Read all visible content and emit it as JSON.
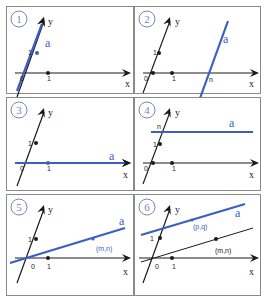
{
  "colors": {
    "line_a": "#3a5fc0",
    "axis": "#1a1a1a",
    "badge": "#7a86b8",
    "border": "#8a8a8a"
  },
  "panels": [
    {
      "id": 1,
      "badge": "1",
      "box": {
        "x": 6,
        "y": 6,
        "w": 128,
        "h": 88
      },
      "origin": {
        "x": 22,
        "y": 66
      },
      "x_axis": {
        "x1": 8,
        "x2": 124,
        "label": "x",
        "label_pos": {
          "x": 118,
          "y": 80
        }
      },
      "y_axis": {
        "x1": 10,
        "y1": 90,
        "x2": 37,
        "y2": 10,
        "label": "y",
        "label_pos": {
          "x": 41,
          "y": 18
        }
      },
      "ticks": [
        {
          "label": "0",
          "x": 13,
          "y": 74,
          "dot": false
        },
        {
          "label": "1",
          "x": 21,
          "y": 48,
          "dot": true,
          "dx": 30,
          "dy": 46,
          "blue": true
        },
        {
          "label": "1",
          "x": 40,
          "y": 74,
          "dot": true,
          "dx": 41,
          "dy": 66
        }
      ],
      "line_a": {
        "x1": 10,
        "y1": 84,
        "x2": 36,
        "y2": 14,
        "arrow": true
      },
      "a_label": {
        "text": "a",
        "x": 38,
        "y": 40
      },
      "points": [],
      "extra_lines": []
    },
    {
      "id": 2,
      "badge": "2",
      "box": {
        "x": 134,
        "y": 6,
        "w": 127,
        "h": 88
      },
      "origin": {
        "x": 18,
        "y": 66
      },
      "x_axis": {
        "x1": 8,
        "x2": 124,
        "label": "x",
        "label_pos": {
          "x": 114,
          "y": 80
        }
      },
      "y_axis": {
        "x1": 8,
        "y1": 86,
        "x2": 35,
        "y2": 10,
        "label": "y",
        "label_pos": {
          "x": 40,
          "y": 18
        }
      },
      "ticks": [
        {
          "label": "0",
          "x": 9,
          "y": 74,
          "dot": true,
          "dx": 18,
          "dy": 66
        },
        {
          "label": "1",
          "x": 18,
          "y": 48,
          "dot": true,
          "dx": 24,
          "dy": 46
        },
        {
          "label": "1",
          "x": 37,
          "y": 74,
          "dot": true,
          "dx": 37,
          "dy": 66
        }
      ],
      "line_a": {
        "x1": 64,
        "y1": 94,
        "x2": 93,
        "y2": 14,
        "arrow": false
      },
      "a_label": {
        "text": "a",
        "x": 88,
        "y": 36
      },
      "points": [],
      "n_label": {
        "text": "n",
        "x": 74,
        "y": 75
      },
      "extra_lines": []
    },
    {
      "id": 3,
      "badge": "3",
      "box": {
        "x": 6,
        "y": 97,
        "w": 128,
        "h": 94
      },
      "origin": {
        "x": 22,
        "y": 65
      },
      "x_axis": {
        "x1": 8,
        "x2": 124,
        "label": "x",
        "label_pos": {
          "x": 116,
          "y": 80
        }
      },
      "y_axis": {
        "x1": 10,
        "y1": 88,
        "x2": 37,
        "y2": 10,
        "label": "y",
        "label_pos": {
          "x": 41,
          "y": 18
        }
      },
      "ticks": [
        {
          "label": "0",
          "x": 13,
          "y": 73,
          "dot": false
        },
        {
          "label": "1",
          "x": 21,
          "y": 48,
          "dot": true,
          "dx": 29,
          "dy": 45
        },
        {
          "label": "1",
          "x": 40,
          "y": 73,
          "dot": true,
          "dx": 41,
          "dy": 65,
          "blue": true
        }
      ],
      "line_a": {
        "x1": 8,
        "y1": 65,
        "x2": 124,
        "y2": 65,
        "arrow": true,
        "horizontal_axis_overlay": true
      },
      "a_label": {
        "text": "a",
        "x": 102,
        "y": 62
      },
      "points": [],
      "extra_lines": []
    },
    {
      "id": 4,
      "badge": "4",
      "box": {
        "x": 134,
        "y": 97,
        "w": 127,
        "h": 94
      },
      "origin": {
        "x": 18,
        "y": 65
      },
      "x_axis": {
        "x1": 8,
        "x2": 124,
        "label": "x",
        "label_pos": {
          "x": 114,
          "y": 80
        }
      },
      "y_axis": {
        "x1": 8,
        "y1": 86,
        "x2": 35,
        "y2": 10,
        "label": "y",
        "label_pos": {
          "x": 40,
          "y": 18
        }
      },
      "ticks": [
        {
          "label": "0",
          "x": 9,
          "y": 73,
          "dot": true,
          "dx": 18,
          "dy": 65
        },
        {
          "label": "1",
          "x": 18,
          "y": 49,
          "dot": true,
          "dx": 25,
          "dy": 46
        },
        {
          "label": "1",
          "x": 37,
          "y": 73,
          "dot": true,
          "dx": 37,
          "dy": 65
        }
      ],
      "line_a": {
        "x1": 16,
        "y1": 34,
        "x2": 118,
        "y2": 34,
        "arrow": false
      },
      "a_label": {
        "text": "a",
        "x": 94,
        "y": 29
      },
      "n_label": {
        "text": "n",
        "x": 22,
        "y": 31
      },
      "points": [],
      "extra_lines": []
    },
    {
      "id": 5,
      "badge": "5",
      "box": {
        "x": 6,
        "y": 194,
        "w": 128,
        "h": 102
      },
      "origin": {
        "x": 22,
        "y": 63
      },
      "x_axis": {
        "x1": 8,
        "x2": 124,
        "label": "x",
        "label_pos": {
          "x": 116,
          "y": 80
        }
      },
      "y_axis": {
        "x1": 10,
        "y1": 88,
        "x2": 37,
        "y2": 10,
        "label": "y",
        "label_pos": {
          "x": 41,
          "y": 18
        }
      },
      "ticks": [
        {
          "label": "0",
          "x": 24,
          "y": 74,
          "dot": false
        },
        {
          "label": "1",
          "x": 21,
          "y": 47,
          "dot": true,
          "dx": 29,
          "dy": 44
        },
        {
          "label": "1",
          "x": 40,
          "y": 74,
          "dot": true,
          "dx": 41,
          "dy": 63
        }
      ],
      "line_a": {
        "x1": 3,
        "y1": 68,
        "x2": 118,
        "y2": 33,
        "arrow": false
      },
      "a_label": {
        "text": "a",
        "x": 112,
        "y": 30
      },
      "points": [
        {
          "label": "(m,n)",
          "x": 86,
          "y": 44,
          "lx": 89,
          "ly": 56,
          "blue": true
        }
      ],
      "extra_lines": []
    },
    {
      "id": 6,
      "badge": "6",
      "box": {
        "x": 134,
        "y": 194,
        "w": 127,
        "h": 102
      },
      "origin": {
        "x": 18,
        "y": 63
      },
      "x_axis": {
        "x1": 4,
        "x2": 124,
        "label": "x",
        "label_pos": {
          "x": 114,
          "y": 80
        }
      },
      "y_axis": {
        "x1": 8,
        "y1": 88,
        "x2": 35,
        "y2": 10,
        "label": "y",
        "label_pos": {
          "x": 40,
          "y": 18
        }
      },
      "ticks": [
        {
          "label": "0",
          "x": 20,
          "y": 74,
          "dot": false
        },
        {
          "label": "1",
          "x": 15,
          "y": 46,
          "dot": true,
          "dx": 25,
          "dy": 43
        },
        {
          "label": "1",
          "x": 37,
          "y": 74,
          "dot": true,
          "dx": 37,
          "dy": 63
        }
      ],
      "line_a": {
        "x1": 6,
        "y1": 40,
        "x2": 110,
        "y2": 9,
        "arrow": false
      },
      "a_label": {
        "text": "a",
        "x": 100,
        "y": 22
      },
      "points": [
        {
          "label": "(p,q)",
          "x": 57,
          "y": 25,
          "lx": 58,
          "ly": 34,
          "blue": true
        },
        {
          "label": "(m,n)",
          "x": 81,
          "y": 44,
          "lx": 80,
          "ly": 58,
          "blue": false
        }
      ],
      "extra_lines": [
        {
          "x1": 6,
          "y1": 67,
          "x2": 118,
          "y2": 33
        }
      ]
    }
  ]
}
